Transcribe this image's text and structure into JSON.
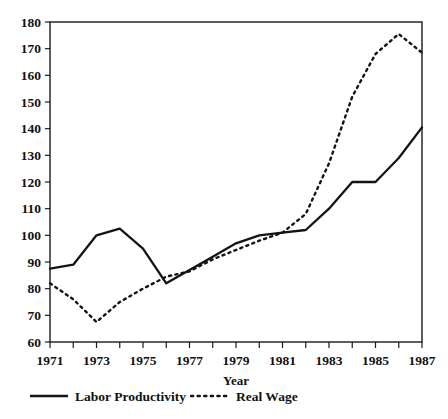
{
  "chart_data": {
    "type": "line",
    "title": "",
    "subtitle": "",
    "xlabel": "Year",
    "ylabel": "",
    "xlim": [
      1971,
      1987
    ],
    "ylim": [
      60,
      180
    ],
    "ytick_step": 10,
    "xtick_step": 1,
    "xtick_label_step": 2,
    "grid": false,
    "legend_position": "bottom-left",
    "x": [
      1971,
      1972,
      1973,
      1974,
      1975,
      1976,
      1977,
      1978,
      1979,
      1980,
      1981,
      1982,
      1983,
      1984,
      1985,
      1986,
      1987
    ],
    "categories": [
      "1971",
      "1972",
      "1973",
      "1974",
      "1975",
      "1976",
      "1977",
      "1978",
      "1979",
      "1980",
      "1981",
      "1982",
      "1983",
      "1984",
      "1985",
      "1986",
      "1987"
    ],
    "xtick_labels": [
      "1971",
      "1973",
      "1975",
      "1977",
      "1979",
      "1981",
      "1983",
      "1985",
      "1987"
    ],
    "ytick_labels": [
      "60",
      "70",
      "80",
      "90",
      "100",
      "110",
      "120",
      "130",
      "140",
      "150",
      "160",
      "170",
      "180"
    ],
    "series": [
      {
        "name": "Labor Productivity",
        "style": "solid",
        "color": "#141414",
        "values": [
          87.5,
          89.0,
          100.0,
          102.5,
          95.0,
          82.0,
          87.0,
          92.0,
          97.0,
          100.0,
          101.0,
          102.0,
          110.0,
          120.0,
          120.0,
          129.0,
          140.5
        ]
      },
      {
        "name": "Real Wage",
        "style": "dashed",
        "color": "#141414",
        "values": [
          82.0,
          76.0,
          67.5,
          75.0,
          80.0,
          84.5,
          86.5,
          91.0,
          94.5,
          98.0,
          101.0,
          108.0,
          127.0,
          152.0,
          168.0,
          175.5,
          168.5
        ]
      }
    ],
    "legend": [
      {
        "label": "Labor Productivity",
        "style": "solid"
      },
      {
        "label": "Real Wage",
        "style": "dashed"
      }
    ]
  }
}
